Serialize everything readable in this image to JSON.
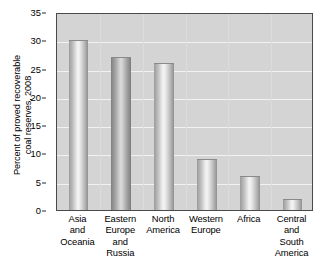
{
  "chart_data": {
    "type": "bar",
    "title": "",
    "xlabel": "",
    "ylabel": "Percent of proved recoverable coal reserves, 2008",
    "ylabel_lines": [
      "Percent of proved recoverable",
      "coal reserves, 2008"
    ],
    "categories": [
      "Asia and Oceania",
      "Eastern Europe and Russia",
      "North America",
      "Western Europe",
      "Africa",
      "Central and South America"
    ],
    "category_lines": [
      [
        "Asia",
        "and",
        "Oceania"
      ],
      [
        "Eastern",
        "Europe",
        "and",
        "Russia"
      ],
      [
        "North",
        "America"
      ],
      [
        "Western",
        "Europe"
      ],
      [
        "Africa"
      ],
      [
        "Central",
        "and",
        "South",
        "America"
      ]
    ],
    "values": [
      30,
      27,
      26,
      9,
      6,
      2
    ],
    "ylim": [
      0,
      35
    ],
    "yticks": [
      0,
      5,
      10,
      15,
      20,
      25,
      30,
      35
    ],
    "ytick_labels": [
      "0",
      "5",
      "10",
      "15",
      "20",
      "25",
      "30",
      "35"
    ],
    "grid": true,
    "grid_axis": "y",
    "legend": false,
    "legend_position": "none",
    "colors": {
      "plot_background": "#d4d4d4",
      "gridline": "#f2f2f2",
      "axis": "#4a4a4a",
      "bar_light": "#f4f4f4",
      "bar_shadow": "#8e8e8e",
      "text": "#000000",
      "figure_background": "#ffffff"
    }
  }
}
